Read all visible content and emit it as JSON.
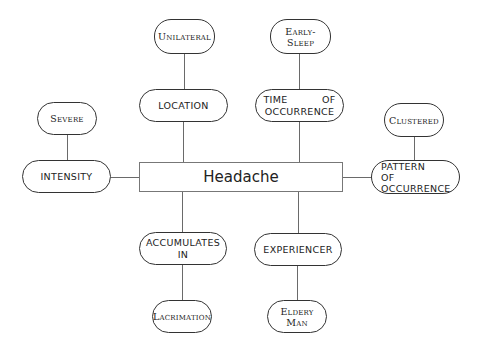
{
  "diagram": {
    "center": {
      "label": "Headache"
    },
    "roles": {
      "intensity": {
        "label": "INTENSITY",
        "value": "Severe"
      },
      "location": {
        "label": "LOCATION",
        "value": "Unilateral"
      },
      "time_of_occurrence": {
        "line1a": "TIME",
        "line1b": "OF",
        "line2": "OCCURRENCE",
        "value": "Early-Sleep"
      },
      "pattern_of_occurrence": {
        "line1": "PATTERN",
        "line2": "OF",
        "line3": "OCCURRENCE",
        "value": "Clustered"
      },
      "accumulates_in": {
        "line1": "ACCUMULATES",
        "line2": "IN",
        "value": "Lacrimation"
      },
      "experiencer": {
        "label": "EXPERIENCER",
        "value": "Eldery Man"
      }
    }
  }
}
